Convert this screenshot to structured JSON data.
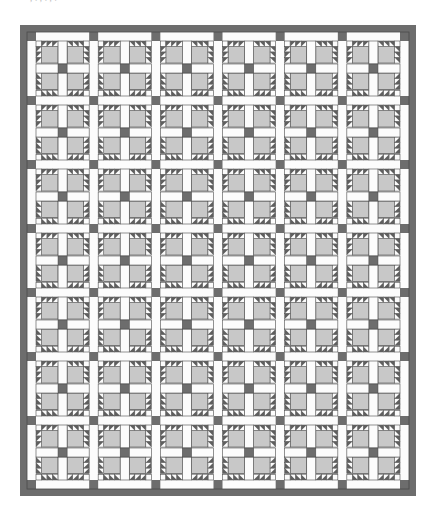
{
  "page": {
    "width": 431,
    "height": 526,
    "background": "#ffffff"
  },
  "header_text": {
    "clipped_caption": "        ,                       .        ,                   .          ,                  ."
  },
  "figure": {
    "name": "bear-paw-quilt-diagram",
    "x": 20,
    "y": 25,
    "width": 396,
    "height": 471
  },
  "palette": {
    "background": "#ffffff",
    "border_dark": "#6d6d6d",
    "patch_gray": "#c8c8c8",
    "sashing_white": "#fcfcfc",
    "cornerstone_dark": "#6d6d6d",
    "triangle_dark": "#5f5f5f",
    "outline": "#4a4a4a",
    "caption_gray": "#b9b9b9"
  },
  "quilt": {
    "border_width": 7,
    "block_columns": 6,
    "block_rows": 7,
    "block_size": 63,
    "sashing_width": 9,
    "paw_square_size": 20,
    "triangles_per_edge": 3,
    "outer_left": 20,
    "outer_top": 25,
    "outer_width": 396,
    "outer_height": 471,
    "inner_left": 27,
    "inner_top": 32,
    "inner_width": 382,
    "inner_height": 457,
    "description": "Bear Paw blocks set with white sashing and dark cornerstones, framed by a dark solid border"
  },
  "chart_data": {
    "type": "diagram",
    "grid_columns": 6,
    "grid_rows": 7,
    "unit_block": "bear-paw",
    "paws_per_block": 4,
    "hst_triangles_per_paw": 6
  }
}
